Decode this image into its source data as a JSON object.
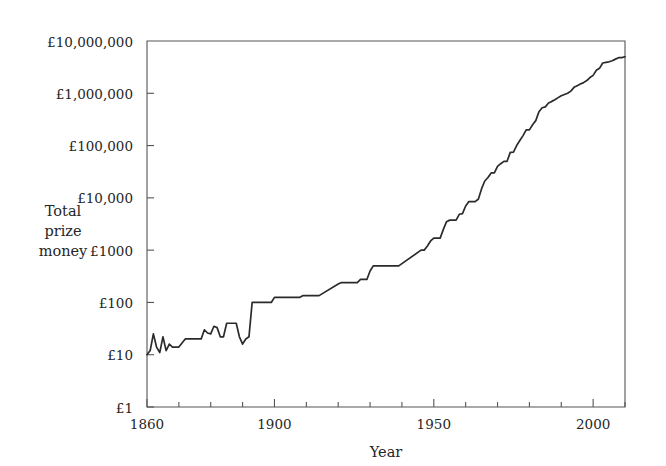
{
  "chart_data": {
    "type": "line",
    "title": "",
    "xlabel": "Year",
    "ylabel": "Total prize money",
    "ylabel_lines": [
      "Total",
      "prize",
      "money"
    ],
    "yscale": "log",
    "xlim": [
      1860,
      2010
    ],
    "ylim": [
      1,
      10000000
    ],
    "grid": false,
    "legend": null,
    "line_color": "#2b2b2b",
    "frame_color": "#555555",
    "y_tick_labels": [
      "£10,000,000",
      "£1,000,000",
      "£100,000",
      "£10,000",
      "£1000",
      "£100",
      "£10",
      "£1"
    ],
    "y_tick_values": [
      10000000,
      1000000,
      100000,
      10000,
      1000,
      100,
      10,
      1
    ],
    "x_tick_labels": [
      "1860",
      "1900",
      "1950",
      "2000"
    ],
    "x_tick_values": [
      1860,
      1900,
      1950,
      2000
    ],
    "x_minor_step": 10,
    "x": [
      1860,
      1861,
      1862,
      1863,
      1864,
      1865,
      1866,
      1867,
      1868,
      1869,
      1870,
      1872,
      1873,
      1874,
      1875,
      1876,
      1877,
      1878,
      1879,
      1880,
      1881,
      1882,
      1883,
      1884,
      1885,
      1886,
      1887,
      1888,
      1889,
      1890,
      1891,
      1892,
      1893,
      1894,
      1895,
      1896,
      1897,
      1898,
      1899,
      1900,
      1901,
      1902,
      1903,
      1904,
      1905,
      1906,
      1907,
      1908,
      1909,
      1910,
      1911,
      1912,
      1913,
      1914,
      1920,
      1921,
      1922,
      1923,
      1924,
      1925,
      1926,
      1927,
      1928,
      1929,
      1930,
      1931,
      1932,
      1933,
      1934,
      1935,
      1936,
      1937,
      1938,
      1939,
      1946,
      1947,
      1948,
      1949,
      1950,
      1951,
      1952,
      1953,
      1954,
      1955,
      1956,
      1957,
      1958,
      1959,
      1960,
      1961,
      1962,
      1963,
      1964,
      1965,
      1966,
      1967,
      1968,
      1969,
      1970,
      1971,
      1972,
      1973,
      1974,
      1975,
      1976,
      1977,
      1978,
      1979,
      1980,
      1981,
      1982,
      1983,
      1984,
      1985,
      1986,
      1987,
      1988,
      1989,
      1990,
      1991,
      1992,
      1993,
      1994,
      1995,
      1996,
      1997,
      1998,
      1999,
      2000,
      2001,
      2002,
      2003,
      2004,
      2005,
      2006,
      2007,
      2008,
      2009,
      2010
    ],
    "y": [
      10,
      12,
      25,
      14,
      11,
      22,
      12,
      16,
      14,
      14,
      14,
      20,
      20,
      20,
      20,
      20,
      20,
      30,
      26,
      25,
      35,
      33,
      22,
      22,
      40,
      40,
      40,
      40,
      22,
      16,
      20,
      22,
      100,
      100,
      100,
      100,
      100,
      100,
      100,
      125,
      125,
      125,
      125,
      125,
      125,
      125,
      125,
      125,
      135,
      135,
      135,
      135,
      135,
      135,
      225,
      240,
      240,
      240,
      240,
      240,
      240,
      275,
      275,
      275,
      400,
      500,
      500,
      500,
      500,
      500,
      500,
      500,
      500,
      500,
      1000,
      1000,
      1200,
      1500,
      1700,
      1700,
      1700,
      2500,
      3500,
      3750,
      3750,
      3750,
      4850,
      5000,
      7000,
      8500,
      8500,
      8500,
      9500,
      15000,
      21000,
      24500,
      30000,
      30000,
      40000,
      45000,
      50000,
      50000,
      74000,
      75000,
      100000,
      125000,
      155000,
      200000,
      200000,
      250000,
      300000,
      445000,
      530000,
      550000,
      650000,
      700000,
      750000,
      825000,
      900000,
      950000,
      1000000,
      1100000,
      1300000,
      1400000,
      1500000,
      1600000,
      1750000,
      2000000,
      2200000,
      2750000,
      3000000,
      3800000,
      3900000,
      4000000,
      4200000,
      4500000,
      4800000,
      4800000,
      5000000,
      5300000,
      4800000,
      4800000
    ]
  }
}
